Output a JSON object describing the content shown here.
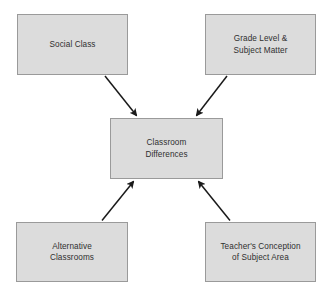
{
  "diagram": {
    "type": "concept-map",
    "background_color": "#ffffff",
    "node_fill_color": "#dcdcdc",
    "node_border_color": "#9a9a9a",
    "text_color": "#2f2f2f",
    "arrow_color": "#1a1a1a",
    "nodes": [
      {
        "id": "social-class",
        "label": "Social Class",
        "role": "source"
      },
      {
        "id": "grade-level-subject-matter",
        "label": "Grade Level &\nSubject Matter",
        "role": "source"
      },
      {
        "id": "classroom-differences",
        "label": "Classroom\nDifferences",
        "role": "center"
      },
      {
        "id": "alternative-classrooms",
        "label": "Alternative\nClassrooms",
        "role": "source"
      },
      {
        "id": "teachers-conception-of-subject-area",
        "label": "Teacher's Conception\nof Subject Area",
        "role": "source"
      }
    ],
    "edges": [
      {
        "from": "social-class",
        "to": "classroom-differences",
        "direction": "to-center"
      },
      {
        "from": "grade-level-subject-matter",
        "to": "classroom-differences",
        "direction": "to-center"
      },
      {
        "from": "alternative-classrooms",
        "to": "classroom-differences",
        "direction": "to-center"
      },
      {
        "from": "teachers-conception-of-subject-area",
        "to": "classroom-differences",
        "direction": "to-center"
      }
    ]
  }
}
